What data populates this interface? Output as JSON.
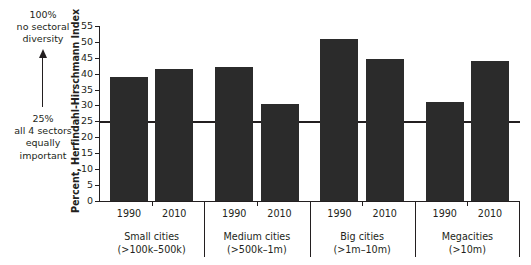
{
  "chart_data": {
    "type": "bar",
    "title": "",
    "xlabel": "",
    "ylabel": "Percent, Herfindahl-Hirschmann Index",
    "ylim": [
      0,
      55
    ],
    "ytick_step": 5,
    "yticks": [
      "0",
      "5",
      "10",
      "15",
      "20",
      "25",
      "30",
      "35",
      "40",
      "45",
      "50",
      "55"
    ],
    "grid": false,
    "legend": "none",
    "bar_color": "#2b2b2b",
    "axis_color": "#231f20",
    "reference_line": {
      "value": 25,
      "label": "25% all 4 sectors equally important"
    },
    "categories": [
      "1990",
      "2010",
      "1990",
      "2010",
      "1990",
      "2010",
      "1990",
      "2010"
    ],
    "values": [
      39,
      41.5,
      42,
      30.5,
      51,
      44.5,
      31,
      44
    ],
    "groups": [
      {
        "name": "Small cities",
        "range": "(>100k–500k)",
        "years": [
          "1990",
          "2010"
        ],
        "values": [
          39,
          41.5
        ]
      },
      {
        "name": "Medium cities",
        "range": "(>500k–1m)",
        "years": [
          "1990",
          "2010"
        ],
        "values": [
          42,
          30.5
        ]
      },
      {
        "name": "Big cities",
        "range": "(>1m–10m)",
        "years": [
          "1990",
          "2010"
        ],
        "values": [
          51,
          44.5
        ]
      },
      {
        "name": "Megacities",
        "range": "(>10m)",
        "years": [
          "1990",
          "2010"
        ],
        "values": [
          31,
          44
        ]
      }
    ]
  },
  "annotations": {
    "top": {
      "line1": "100%",
      "line2": "no sectoral",
      "line3": "diversity"
    },
    "bottom": {
      "line1": "25%",
      "line2": "all 4 sectors",
      "line3": "equally",
      "line4": "important"
    }
  }
}
